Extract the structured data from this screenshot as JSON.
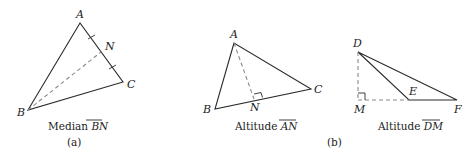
{
  "figure_a": {
    "vertices": {
      "A": "A",
      "B": "B",
      "C": "C",
      "N": "N"
    },
    "caption_prefix": "Median ",
    "caption_segment": "BN",
    "panel_label": "(a)"
  },
  "figure_b1": {
    "vertices": {
      "A": "A",
      "B": "B",
      "C": "C",
      "N": "N"
    },
    "caption_prefix": "Altitude ",
    "caption_segment": "AN"
  },
  "figure_b2": {
    "vertices": {
      "D": "D",
      "E": "E",
      "F": "F",
      "M": "M"
    },
    "caption_prefix": "Altitude ",
    "caption_segment": "DM"
  },
  "panel_b_label": "(b)",
  "colors": {
    "line": "#2a2a2a",
    "dashed": "#8a8a8a",
    "text": "#222222"
  }
}
